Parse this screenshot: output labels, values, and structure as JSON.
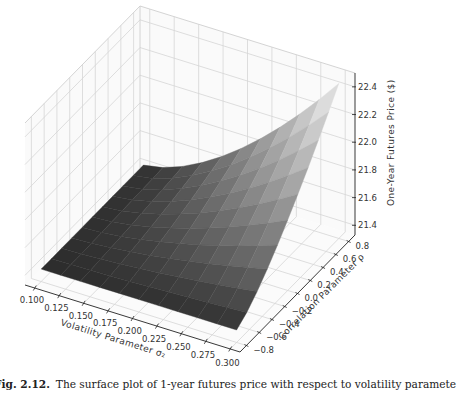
{
  "chart_data": {
    "type": "surface3d",
    "title": "",
    "xlabel": "Volatility Parameter σ₂",
    "ylabel": "Correlation Parameter ρ",
    "zlabel": "One-Year Futures Price ($)",
    "x_ticks": [
      "0.100",
      "0.125",
      "0.150",
      "0.175",
      "0.200",
      "0.225",
      "0.250",
      "0.275",
      "0.300"
    ],
    "y_ticks": [
      "-0.8",
      "-0.6",
      "-0.4",
      "-0.2",
      "0.0",
      "0.2",
      "0.4",
      "0.6",
      "0.8"
    ],
    "z_ticks": [
      "21.4",
      "21.6",
      "21.8",
      "22.0",
      "22.2",
      "22.4"
    ],
    "xlim": [
      0.09,
      0.31
    ],
    "ylim": [
      -0.9,
      0.9
    ],
    "zlim": [
      21.33,
      22.5
    ],
    "grid": true,
    "colormap": "grayscale (dark = low, light = high)",
    "x": [
      0.1,
      0.125,
      0.15,
      0.175,
      0.2,
      0.225,
      0.25,
      0.275,
      0.3
    ],
    "y": [
      -0.8,
      -0.6,
      -0.4,
      -0.2,
      0.0,
      0.2,
      0.4,
      0.6,
      0.8
    ],
    "corner_values": {
      "x0.1_y-0.8": 21.42,
      "x0.1_y0.8": 21.42,
      "x0.3_y-0.8": 21.42,
      "x0.3_y0.8": 22.45
    },
    "model": "z = 21.42 + 1.03 * ((x-0.1)/0.2)^1.6 * ((y+0.8)/1.6)^1.3"
  },
  "caption": {
    "label": "Fig. 2.12.",
    "text": "The surface plot of 1-year futures price with respect to volatility paramete"
  }
}
